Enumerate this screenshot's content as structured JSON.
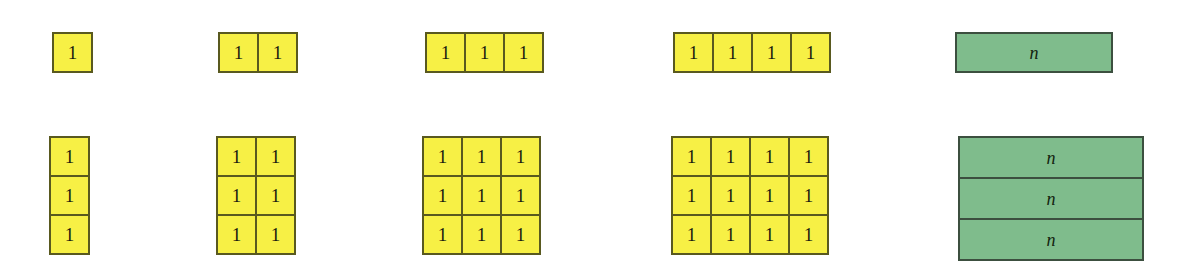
{
  "figure": {
    "title": "",
    "unit_label": "1",
    "variable_label": "n",
    "colors": {
      "unit_fill": "#f7f045",
      "unit_border": "#59591f",
      "variable_fill": "#7fbc8c",
      "variable_border": "#3c4f3f",
      "background": "#ffffff",
      "text": "#1c1c10"
    },
    "rows": [
      {
        "name": "top-row",
        "y": 32,
        "groups": [
          {
            "name": "group-1-by-1",
            "kind": "unit-grid",
            "x": 52,
            "cols": 1,
            "rows": 1,
            "cells": [
              [
                "1"
              ]
            ]
          },
          {
            "name": "group-2-by-1",
            "kind": "unit-grid",
            "x": 218,
            "cols": 2,
            "rows": 1,
            "cells": [
              [
                "1",
                "1"
              ]
            ]
          },
          {
            "name": "group-3-by-1",
            "kind": "unit-grid",
            "x": 425,
            "cols": 3,
            "rows": 1,
            "cells": [
              [
                "1",
                "1",
                "1"
              ]
            ]
          },
          {
            "name": "group-4-by-1",
            "kind": "unit-grid",
            "x": 673,
            "cols": 4,
            "rows": 1,
            "cells": [
              [
                "1",
                "1",
                "1",
                "1"
              ]
            ]
          },
          {
            "name": "group-n-by-1",
            "kind": "variable-stack",
            "x": 955,
            "bars": [
              "n"
            ]
          }
        ]
      },
      {
        "name": "bottom-row",
        "y": 136,
        "groups": [
          {
            "name": "group-1-by-3",
            "kind": "unit-grid",
            "x": 49,
            "cols": 1,
            "rows": 3,
            "cells": [
              [
                "1"
              ],
              [
                "1"
              ],
              [
                "1"
              ]
            ]
          },
          {
            "name": "group-2-by-3",
            "kind": "unit-grid",
            "x": 216,
            "cols": 2,
            "rows": 3,
            "cells": [
              [
                "1",
                "1"
              ],
              [
                "1",
                "1"
              ],
              [
                "1",
                "1"
              ]
            ]
          },
          {
            "name": "group-3-by-3",
            "kind": "unit-grid",
            "x": 422,
            "cols": 3,
            "rows": 3,
            "cells": [
              [
                "1",
                "1",
                "1"
              ],
              [
                "1",
                "1",
                "1"
              ],
              [
                "1",
                "1",
                "1"
              ]
            ]
          },
          {
            "name": "group-4-by-3",
            "kind": "unit-grid",
            "x": 671,
            "cols": 4,
            "rows": 3,
            "cells": [
              [
                "1",
                "1",
                "1",
                "1"
              ],
              [
                "1",
                "1",
                "1",
                "1"
              ],
              [
                "1",
                "1",
                "1",
                "1"
              ]
            ]
          },
          {
            "name": "group-n-by-3",
            "kind": "variable-stack",
            "x": 958,
            "bars": [
              "n",
              "n",
              "n"
            ]
          }
        ]
      }
    ]
  }
}
